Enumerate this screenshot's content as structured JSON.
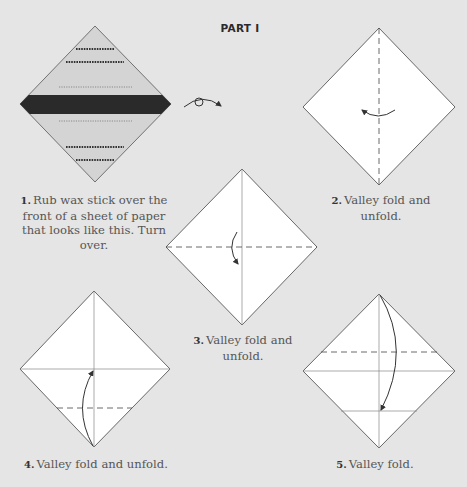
{
  "header": {
    "title": "PART I"
  },
  "steps": [
    {
      "number": "1.",
      "text": "Rub wax stick over the front of a sheet of paper that looks like this. Turn over."
    },
    {
      "number": "2.",
      "text": "Valley fold and unfold."
    },
    {
      "number": "3.",
      "text": "Valley fold and unfold."
    },
    {
      "number": "4.",
      "text": "Valley fold and unfold."
    },
    {
      "number": "5.",
      "text": "Valley fold."
    }
  ],
  "colors": {
    "background": "#e5e5e5",
    "paper": "#ffffff",
    "paper_shaded": "#d4d4d4",
    "wax_band": "#2a2a2a",
    "line": "#444444"
  },
  "icons": [
    "turn-over-icon",
    "fold-arrow-icon"
  ]
}
